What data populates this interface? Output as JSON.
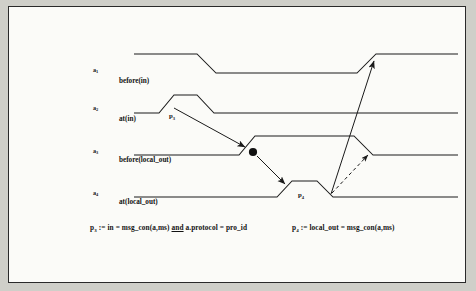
{
  "figure": {
    "type": "timing-diagram",
    "background_color": "#cfcfc9",
    "panel_color": "#fbfbf8",
    "line_color": "#1a1a1a",
    "signals": [
      {
        "id": "a1",
        "name": "a",
        "index": "1",
        "description": "before(in)",
        "baseline_y": 72,
        "high_y": 53,
        "transitions": "high, fall at 196-215, low, rise at 355-375"
      },
      {
        "id": "a2",
        "name": "a",
        "index": "2",
        "description": "at(in)",
        "baseline_y": 112,
        "high_y": 94,
        "transitions": "low, rise at 158-172, high, fall at 195-212"
      },
      {
        "id": "a3",
        "name": "a",
        "index": "3",
        "description": "before(local_out)",
        "baseline_y": 154,
        "high_y": 135,
        "transitions": "low, rise at 238-253, high, fall at 352-371"
      },
      {
        "id": "a4",
        "name": "a",
        "index": "4",
        "description": "at(local_out)",
        "baseline_y": 196,
        "high_y": 180,
        "transitions": "low, rise at 276-290, high, fall at 315-331"
      }
    ],
    "predicate_marks": [
      {
        "id": "p3-mark",
        "name": "p",
        "index": "3",
        "x": 167,
        "y": 113
      },
      {
        "id": "p4-mark",
        "name": "p",
        "index": "4",
        "x": 296,
        "y": 192
      }
    ],
    "event_dot": {
      "x": 252,
      "y": 151,
      "radius": 4.1
    },
    "arrows": [
      {
        "id": "p3-to-a3",
        "style": "solid",
        "from": [
          173,
          107
        ],
        "to": [
          244,
          146
        ]
      },
      {
        "id": "a3-to-a4",
        "style": "solid",
        "from": [
          256,
          155
        ],
        "to": [
          284,
          183
        ]
      },
      {
        "id": "a4-to-a1",
        "style": "solid",
        "from": [
          330,
          193
        ],
        "to": [
          373,
          60
        ]
      },
      {
        "id": "a4-to-a3-dashed",
        "style": "dashed",
        "from": [
          331,
          192
        ],
        "to": [
          367,
          154
        ]
      }
    ],
    "formulas": [
      {
        "id": "p3-definition",
        "name": "p",
        "index": "3",
        "assign": ":=",
        "body_before_and": "in = msg_con(a,ms)",
        "connective": "and",
        "body_after_and": "a.protocol = pro_id",
        "x": 88,
        "y": 223
      },
      {
        "id": "p4-definition",
        "name": "p",
        "index": "4",
        "assign": ":=",
        "body_before_and": "local_out = msg_con(a,ms)",
        "connective": "",
        "body_after_and": "",
        "x": 290,
        "y": 223
      }
    ]
  }
}
